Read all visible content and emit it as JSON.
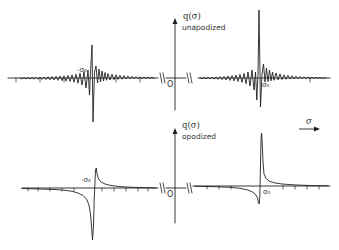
{
  "figure": {
    "top_panel": {
      "y_axis_label": "q(σ)",
      "caption": "unapodized",
      "left_peak_label": "-σ₀",
      "right_peak_label": "σ₀",
      "origin_label": "O"
    },
    "bottom_panel": {
      "y_axis_label": "q(σ)",
      "caption": "opodized",
      "left_peak_label": "-σ₀",
      "right_peak_label": "σ₀",
      "origin_label": "O"
    },
    "x_axis_arrow_label": "σ"
  },
  "colors": {
    "line": "#222222",
    "background": "#ffffff"
  }
}
